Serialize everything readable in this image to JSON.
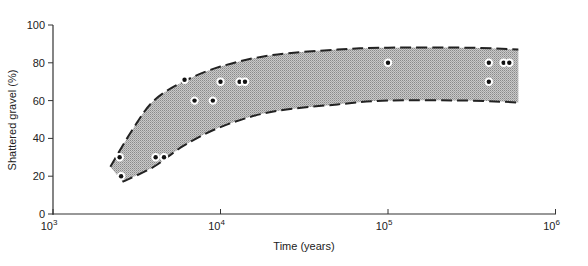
{
  "chart_data": {
    "type": "scatter",
    "title": "",
    "xlabel": "Time (years)",
    "ylabel": "Shattered gravel (%)",
    "xscale": "log",
    "xlim": [
      1000,
      1000000
    ],
    "ylim": [
      0,
      100
    ],
    "x_ticks": [
      {
        "value": 1000,
        "base": "10",
        "exp": "3"
      },
      {
        "value": 10000,
        "base": "10",
        "exp": "4"
      },
      {
        "value": 100000,
        "base": "10",
        "exp": "5"
      },
      {
        "value": 1000000,
        "base": "10",
        "exp": "6"
      }
    ],
    "y_ticks": [
      "0",
      "20",
      "40",
      "60",
      "80",
      "100"
    ],
    "grid": false,
    "legend": null,
    "series": [
      {
        "name": "observations",
        "points": [
          {
            "x": 2500,
            "y": 30
          },
          {
            "x": 2550,
            "y": 20
          },
          {
            "x": 4100,
            "y": 30
          },
          {
            "x": 4600,
            "y": 30
          },
          {
            "x": 6100,
            "y": 71
          },
          {
            "x": 7000,
            "y": 60
          },
          {
            "x": 9000,
            "y": 60
          },
          {
            "x": 10000,
            "y": 70
          },
          {
            "x": 13000,
            "y": 70
          },
          {
            "x": 14000,
            "y": 70
          },
          {
            "x": 100000,
            "y": 80
          },
          {
            "x": 400000,
            "y": 80
          },
          {
            "x": 400000,
            "y": 70
          },
          {
            "x": 490000,
            "y": 80
          },
          {
            "x": 530000,
            "y": 80
          }
        ]
      }
    ],
    "envelope": {
      "description": "Shaded band bounded by dashed curves",
      "upper": [
        [
          2200,
          25
        ],
        [
          3000,
          45
        ],
        [
          4000,
          60
        ],
        [
          6000,
          70
        ],
        [
          10000,
          78
        ],
        [
          20000,
          84
        ],
        [
          50000,
          87
        ],
        [
          100000,
          88
        ],
        [
          300000,
          88
        ],
        [
          600000,
          87
        ]
      ],
      "lower": [
        [
          2600,
          17
        ],
        [
          4000,
          25
        ],
        [
          6000,
          36
        ],
        [
          10000,
          46
        ],
        [
          20000,
          54
        ],
        [
          50000,
          58
        ],
        [
          100000,
          60
        ],
        [
          300000,
          60
        ],
        [
          600000,
          59
        ]
      ]
    }
  }
}
